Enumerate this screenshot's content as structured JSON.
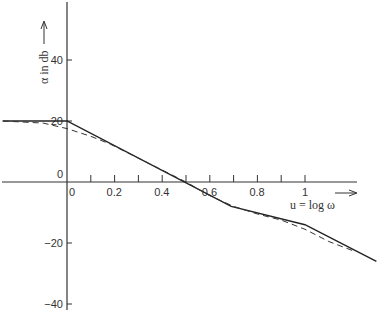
{
  "chart_data": {
    "type": "line",
    "title": "",
    "xlabel": "u = log ω",
    "ylabel": "α in db",
    "x_ticks": [
      0,
      0.1,
      0.2,
      0.3,
      0.4,
      0.5,
      0.6,
      0.7,
      0.8,
      0.9,
      1.0
    ],
    "x_tick_labels": [
      "0",
      "0.2",
      "0.4",
      "0.6",
      "0.8",
      "1"
    ],
    "x_tick_label_values": [
      0,
      0.2,
      0.4,
      0.6,
      0.8,
      1.0
    ],
    "y_tick_labels": [
      "40",
      "20",
      "0",
      "-20",
      "-40"
    ],
    "y_tick_values": [
      40,
      20,
      0,
      -20,
      -40
    ],
    "xlim": [
      -0.27,
      1.3
    ],
    "ylim": [
      -44,
      59
    ],
    "grid": false,
    "legend": null,
    "series": [
      {
        "name": "asymptotic (straight-line) approximation",
        "style": "solid",
        "x": [
          -0.27,
          0.0,
          0.69,
          1.0,
          1.3
        ],
        "y": [
          20,
          20,
          -8,
          -14,
          -26
        ]
      },
      {
        "name": "actual curve",
        "style": "dashed",
        "x": [
          -0.27,
          -0.1,
          0.0,
          0.1,
          0.18,
          0.5,
          0.6,
          0.7,
          0.8,
          0.9,
          1.0,
          1.1,
          1.2
        ],
        "y": [
          20,
          19.3,
          17.5,
          15,
          12.5,
          0,
          -4.5,
          -8,
          -10.5,
          -12.5,
          -15.5,
          -19.5,
          -22.5
        ]
      }
    ]
  },
  "labels": {
    "x_axis": "u = log ω",
    "y_axis": "α in db"
  }
}
